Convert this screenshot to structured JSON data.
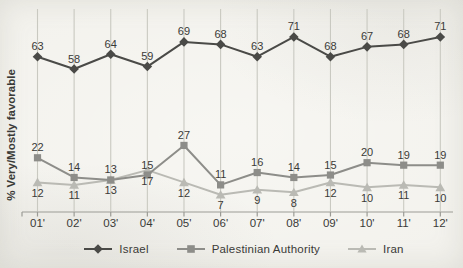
{
  "chart_data": {
    "type": "line",
    "title": "",
    "ylabel": "% Very/Mostly favorable",
    "xlabel": "",
    "categories": [
      "01'",
      "02'",
      "03'",
      "04'",
      "05'",
      "06'",
      "07'",
      "08'",
      "09'",
      "10'",
      "11'",
      "12'"
    ],
    "series": [
      {
        "name": "Israel",
        "marker": "diamond",
        "color": "#4a4a47",
        "label_position": "above",
        "values": [
          63,
          58,
          64,
          59,
          69,
          68,
          63,
          71,
          68,
          67,
          68,
          71
        ],
        "values_plotted": [
          63,
          58,
          64,
          59,
          69,
          68,
          63,
          71,
          63,
          67,
          68,
          71
        ]
      },
      {
        "name": "Palestinian Authority",
        "marker": "square",
        "color": "#8d8d89",
        "label_position": "above",
        "values": [
          22,
          14,
          13,
          15,
          27,
          11,
          16,
          14,
          15,
          20,
          19,
          19
        ]
      },
      {
        "name": "Iran",
        "marker": "triangle",
        "color": "#babab4",
        "label_position": "below",
        "values": [
          12,
          11,
          13,
          17,
          12,
          7,
          9,
          8,
          12,
          10,
          11,
          10
        ]
      }
    ],
    "ylim": [
      0,
      82
    ],
    "grid": "vertical-only",
    "legend_position": "bottom",
    "colors": {
      "background": "#f3f2ed",
      "gridline": "#c9c9c1",
      "axis": "#9b9b95",
      "label_text": "#3a3a37"
    }
  }
}
